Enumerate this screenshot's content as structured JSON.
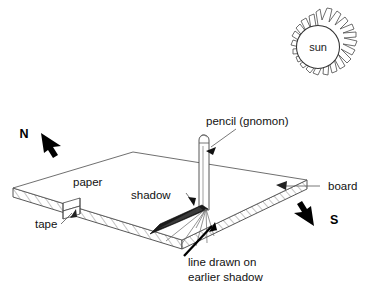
{
  "diagram": {
    "labels": {
      "sun": "sun",
      "north": "N",
      "south": "S",
      "paper": "paper",
      "board": "board",
      "tape": "tape",
      "shadow": "shadow",
      "pencil": "pencil (gnomon)",
      "earlier_line_1": "line drawn on",
      "earlier_line_2": "earlier shadow"
    },
    "icons": {
      "sun": "sun-icon",
      "north_arrow": "north-arrow-icon",
      "south_arrow": "south-arrow-icon",
      "board_pointer": "board-leader-arrow-icon",
      "tape_pointer": "tape-leader-arrow-icon",
      "shadow_pointer": "shadow-leader-arrow-icon",
      "pencil_pointer": "pencil-leader-arrow-icon",
      "earlier_line_pointer": "earlier-shadow-leader-arrow-icon"
    },
    "colors": {
      "ink": "#111111",
      "outline": "#333333",
      "hatch": "#555555",
      "shadow_fill": "#1a1a1a",
      "paper_fill": "#ffffff",
      "background": "#ffffff"
    }
  }
}
